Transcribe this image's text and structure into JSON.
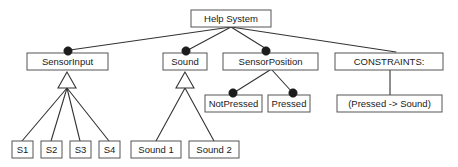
{
  "diagram": {
    "type": "tree-hierarchy",
    "colors": {
      "box_fill": "#ffffff",
      "box_stroke": "#555555",
      "line": "#333333",
      "marker_fill": "#1c1c1c",
      "text": "#1a1a1a",
      "background": "#ffffff"
    },
    "nodes": {
      "help_system": {
        "label": "Help System",
        "x": 191,
        "y": 10,
        "w": 80,
        "h": 17
      },
      "sensor_input": {
        "label": "SensorInput",
        "x": 27,
        "y": 53,
        "w": 81,
        "h": 17
      },
      "sound": {
        "label": "Sound",
        "x": 163,
        "y": 53,
        "w": 44,
        "h": 17
      },
      "sensor_position": {
        "label": "SensorPosition",
        "x": 223,
        "y": 53,
        "w": 95,
        "h": 17
      },
      "constraints": {
        "label": "CONSTRAINTS:",
        "x": 335,
        "y": 53,
        "w": 108,
        "h": 17
      },
      "not_pressed": {
        "label": "NotPressed",
        "x": 205,
        "y": 95,
        "w": 57,
        "h": 17
      },
      "pressed": {
        "label": "Pressed",
        "x": 268,
        "y": 95,
        "w": 42,
        "h": 17
      },
      "constraint_rule": {
        "label": "(Pressed -> Sound)",
        "x": 337,
        "y": 95,
        "w": 105,
        "h": 17
      },
      "s1": {
        "label": "S1",
        "x": 12,
        "y": 141,
        "w": 21,
        "h": 17
      },
      "s2": {
        "label": "S2",
        "x": 41,
        "y": 141,
        "w": 21,
        "h": 17
      },
      "s3": {
        "label": "S3",
        "x": 70,
        "y": 141,
        "w": 21,
        "h": 17
      },
      "s4": {
        "label": "S4",
        "x": 99,
        "y": 141,
        "w": 21,
        "h": 17
      },
      "sound1": {
        "label": "Sound 1",
        "x": 131,
        "y": 141,
        "w": 50,
        "h": 17
      },
      "sound2": {
        "label": "Sound 2",
        "x": 189,
        "y": 141,
        "w": 50,
        "h": 17
      }
    },
    "aggregation_markers": [
      {
        "name": "sensor-input-aggregation",
        "cx": 68,
        "cy": 51,
        "r": 4.2
      },
      {
        "name": "sound-aggregation",
        "cx": 186,
        "cy": 51,
        "r": 4.2
      },
      {
        "name": "sensor-position-aggregation",
        "cx": 266,
        "cy": 51,
        "r": 4.2
      },
      {
        "name": "not-pressed-aggregation",
        "cx": 233,
        "cy": 93,
        "r": 4.2
      },
      {
        "name": "pressed-aggregation",
        "cx": 293,
        "cy": 93,
        "r": 4.2
      }
    ],
    "generalization_triangles": [
      {
        "name": "sensor-input-generalization",
        "apex_x": 67,
        "apex_y": 72,
        "base_y": 88,
        "half_w": 9
      },
      {
        "name": "sound-generalization",
        "apex_x": 185,
        "apex_y": 72,
        "base_y": 88,
        "half_w": 9
      }
    ],
    "edges": [
      {
        "name": "edge-help-system-to-sensor-input",
        "x1": 231,
        "y1": 27,
        "x2": 70,
        "y2": 50
      },
      {
        "name": "edge-help-system-to-sound",
        "x1": 231,
        "y1": 27,
        "x2": 188,
        "y2": 50
      },
      {
        "name": "edge-help-system-to-sensor-position",
        "x1": 231,
        "y1": 27,
        "x2": 268,
        "y2": 50
      },
      {
        "name": "edge-help-system-to-constraints",
        "x1": 231,
        "y1": 27,
        "x2": 396,
        "y2": 52
      },
      {
        "name": "edge-sensor-position-to-not-pressed",
        "x1": 270,
        "y1": 70,
        "x2": 235,
        "y2": 92
      },
      {
        "name": "edge-sensor-position-to-pressed",
        "x1": 272,
        "y1": 70,
        "x2": 292,
        "y2": 92
      },
      {
        "name": "edge-constraints-to-rule",
        "x1": 390,
        "y1": 70,
        "x2": 390,
        "y2": 95
      },
      {
        "name": "edge-sensor-input-to-s1",
        "x1": 67,
        "y1": 88,
        "x2": 22,
        "y2": 141
      },
      {
        "name": "edge-sensor-input-to-s2",
        "x1": 67,
        "y1": 88,
        "x2": 51,
        "y2": 141
      },
      {
        "name": "edge-sensor-input-to-s3",
        "x1": 67,
        "y1": 88,
        "x2": 80,
        "y2": 141
      },
      {
        "name": "edge-sensor-input-to-s4",
        "x1": 67,
        "y1": 88,
        "x2": 109,
        "y2": 141
      },
      {
        "name": "edge-sound-to-sound1",
        "x1": 185,
        "y1": 88,
        "x2": 156,
        "y2": 141
      },
      {
        "name": "edge-sound-to-sound2",
        "x1": 185,
        "y1": 88,
        "x2": 214,
        "y2": 141
      }
    ]
  }
}
